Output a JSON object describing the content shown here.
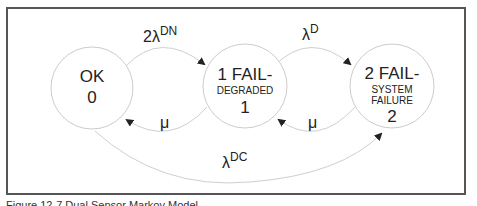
{
  "diagram": {
    "type": "markov-state-transition",
    "states": [
      {
        "id": "0",
        "line1": "OK",
        "line2": "",
        "number": "0"
      },
      {
        "id": "1",
        "line1": "1 FAIL-",
        "line2": "DEGRADED",
        "number": "1"
      },
      {
        "id": "2",
        "line1": "2 FAIL-",
        "line2_a": "SYSTEM",
        "line2_b": "FAILURE",
        "number": "2"
      }
    ],
    "transitions": [
      {
        "from": "0",
        "to": "1",
        "label_base": "2λ",
        "label_sup": "DN"
      },
      {
        "from": "1",
        "to": "2",
        "label_base": "λ",
        "label_sup": "D"
      },
      {
        "from": "1",
        "to": "0",
        "label_base": "μ",
        "label_sup": ""
      },
      {
        "from": "2",
        "to": "1",
        "label_base": "μ",
        "label_sup": ""
      },
      {
        "from": "0",
        "to": "2",
        "label_base": "λ",
        "label_sup": "DC"
      }
    ],
    "colors": {
      "circle_stroke": "#cccccc",
      "arrow": "#222222",
      "frame": "#555555"
    }
  },
  "caption": "Figure 12-7 Dual Sensor Markov Model"
}
